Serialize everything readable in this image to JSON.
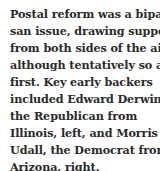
{
  "caption": {
    "lines": [
      "Postal reform was a biparti-",
      "san issue, drawing support",
      "from both sides of the aisle,",
      "although tentatively so at",
      "first.  Key early backers",
      "included Edward Derwinski,",
      "the Republican from",
      "Illinois, left, and Morris",
      "Udall, the Democrat from",
      "Arizona, right."
    ]
  }
}
